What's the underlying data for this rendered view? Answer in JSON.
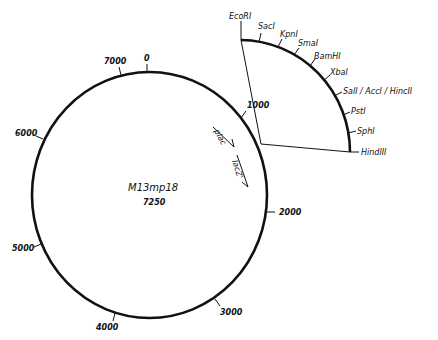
{
  "plasmid": {
    "name": "M13mp18",
    "size_label": "7250",
    "size_bp": 7250
  },
  "scale_ticks": [
    {
      "label": "0",
      "position": 0
    },
    {
      "label": "1000",
      "position": 1000
    },
    {
      "label": "2000",
      "position": 2000
    },
    {
      "label": "3000",
      "position": 3000
    },
    {
      "label": "4000",
      "position": 4000
    },
    {
      "label": "5000",
      "position": 5000
    },
    {
      "label": "6000",
      "position": 6000
    },
    {
      "label": "7000",
      "position": 7000
    }
  ],
  "features": [
    {
      "label": "plac",
      "type": "promoter",
      "direction": "clockwise"
    },
    {
      "label": "lacZ'",
      "type": "gene",
      "direction": "clockwise"
    }
  ],
  "polylinker": {
    "sites": [
      {
        "label": "EcoRI"
      },
      {
        "label": "SacI"
      },
      {
        "label": "KpnI"
      },
      {
        "label": "SmaI"
      },
      {
        "label": "BamHI"
      },
      {
        "label": "XbaI"
      },
      {
        "label": "SalI / AccI / HincII"
      },
      {
        "label": "PstI"
      },
      {
        "label": "SphI"
      },
      {
        "label": "HindIII"
      }
    ]
  },
  "colors": {
    "line": "#111111",
    "background": "#ffffff"
  }
}
